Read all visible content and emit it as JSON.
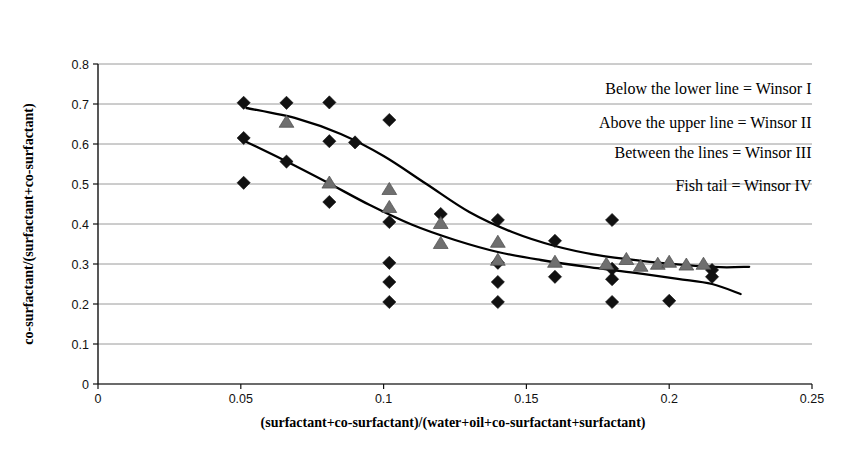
{
  "chart_data": {
    "type": "scatter",
    "title": "",
    "xlabel": "(surfactant+co-surfactant)/(water+oil+co-surfactant+surfactant)",
    "ylabel": "co-surfactant/(surfactant+co-surfactant)",
    "xlim": [
      0,
      0.25
    ],
    "ylim": [
      0,
      0.8
    ],
    "xticks": [
      "0",
      "0.05",
      "0.1",
      "0.15",
      "0.2",
      "0.25"
    ],
    "xtick_values": [
      0,
      0.05,
      0.1,
      0.15,
      0.2,
      0.25
    ],
    "yticks": [
      "0",
      "0.1",
      "0.2",
      "0.3",
      "0.4",
      "0.5",
      "0.6",
      "0.7",
      "0.8"
    ],
    "ytick_values": [
      0,
      0.1,
      0.2,
      0.3,
      0.4,
      0.5,
      0.6,
      0.7,
      0.8
    ],
    "grid": true,
    "grid_axis": "y",
    "legend": "none",
    "series": [
      {
        "name": "diamond-points",
        "marker": "diamond",
        "color": "#111111",
        "points": [
          [
            0.051,
            0.703
          ],
          [
            0.066,
            0.703
          ],
          [
            0.081,
            0.704
          ],
          [
            0.051,
            0.615
          ],
          [
            0.066,
            0.556
          ],
          [
            0.081,
            0.607
          ],
          [
            0.09,
            0.604
          ],
          [
            0.102,
            0.66
          ],
          [
            0.051,
            0.503
          ],
          [
            0.081,
            0.455
          ],
          [
            0.102,
            0.405
          ],
          [
            0.12,
            0.425
          ],
          [
            0.14,
            0.41
          ],
          [
            0.16,
            0.358
          ],
          [
            0.18,
            0.41
          ],
          [
            0.102,
            0.303
          ],
          [
            0.14,
            0.303
          ],
          [
            0.16,
            0.268
          ],
          [
            0.18,
            0.262
          ],
          [
            0.102,
            0.255
          ],
          [
            0.14,
            0.255
          ],
          [
            0.18,
            0.288
          ],
          [
            0.102,
            0.205
          ],
          [
            0.14,
            0.205
          ],
          [
            0.18,
            0.205
          ],
          [
            0.2,
            0.208
          ],
          [
            0.215,
            0.285
          ],
          [
            0.215,
            0.268
          ]
        ]
      },
      {
        "name": "triangle-points",
        "marker": "triangle",
        "color": "#6f6f6f",
        "points": [
          [
            0.066,
            0.655
          ],
          [
            0.081,
            0.503
          ],
          [
            0.102,
            0.487
          ],
          [
            0.102,
            0.442
          ],
          [
            0.12,
            0.402
          ],
          [
            0.12,
            0.352
          ],
          [
            0.14,
            0.355
          ],
          [
            0.14,
            0.31
          ],
          [
            0.16,
            0.305
          ],
          [
            0.178,
            0.3
          ],
          [
            0.185,
            0.312
          ],
          [
            0.19,
            0.295
          ],
          [
            0.196,
            0.3
          ],
          [
            0.2,
            0.305
          ],
          [
            0.206,
            0.298
          ],
          [
            0.212,
            0.3
          ]
        ]
      }
    ],
    "curves": [
      {
        "name": "upper-boundary-curve",
        "color": "#000000",
        "points": [
          [
            0.052,
            0.69
          ],
          [
            0.07,
            0.663
          ],
          [
            0.085,
            0.625
          ],
          [
            0.1,
            0.57
          ],
          [
            0.115,
            0.5
          ],
          [
            0.13,
            0.43
          ],
          [
            0.145,
            0.38
          ],
          [
            0.16,
            0.345
          ],
          [
            0.175,
            0.322
          ],
          [
            0.19,
            0.308
          ],
          [
            0.205,
            0.298
          ],
          [
            0.218,
            0.292
          ],
          [
            0.228,
            0.293
          ]
        ]
      },
      {
        "name": "lower-boundary-curve",
        "color": "#000000",
        "points": [
          [
            0.05,
            0.612
          ],
          [
            0.065,
            0.56
          ],
          [
            0.08,
            0.505
          ],
          [
            0.095,
            0.448
          ],
          [
            0.11,
            0.398
          ],
          [
            0.125,
            0.36
          ],
          [
            0.14,
            0.33
          ],
          [
            0.155,
            0.31
          ],
          [
            0.172,
            0.292
          ],
          [
            0.188,
            0.278
          ],
          [
            0.203,
            0.263
          ],
          [
            0.215,
            0.25
          ],
          [
            0.225,
            0.225
          ]
        ]
      }
    ],
    "annotations": [
      {
        "text": "Below the lower line = Winsor I",
        "x": 0.205,
        "y": 0.725
      },
      {
        "text": "Above the upper line = Winsor II",
        "x": 0.205,
        "y": 0.64
      },
      {
        "text": "Between the lines = Winsor III",
        "x": 0.205,
        "y": 0.565
      },
      {
        "text": "Fish tail = Winsor IV",
        "x": 0.205,
        "y": 0.482
      }
    ]
  }
}
